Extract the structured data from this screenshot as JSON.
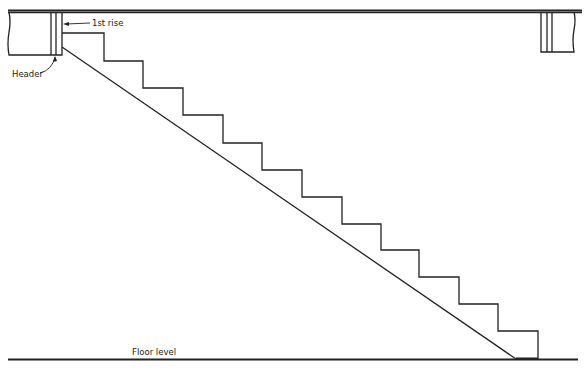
{
  "diagram": {
    "type": "stair-section",
    "labels": {
      "first_rise": "1st rise",
      "header": "Header",
      "floor_level": "Floor level"
    },
    "stroke_color": "#222222",
    "background": "#ffffff",
    "step_count": 13
  }
}
